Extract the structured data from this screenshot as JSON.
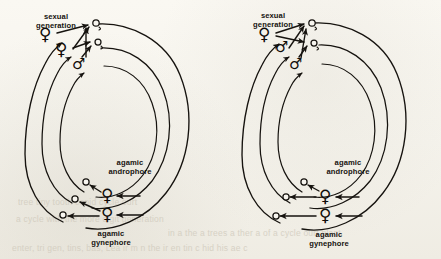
{
  "figure": {
    "background_color": "#f7f5ef",
    "ink_color": "#16130f",
    "panel_count": 2
  },
  "ghost_text": {
    "line1": "tree tiny tooth conid cycle ourt",
    "line2": "a cycle with the more digit generation",
    "line3": "in a the a trees a ther a of a cycle ourt plant",
    "line4": "enter, tri gen, tins, bas, Lea ir m n the ir en tin c hid his ae c"
  },
  "panels": [
    {
      "id": "panel-left",
      "name": "life-cycle-diagram-left",
      "labels": {
        "sexual_generation": [
          "sexual",
          "generation"
        ],
        "agamic_androphore": [
          "agamic",
          "androphore"
        ],
        "agamic_gynephore": [
          "agamic",
          "gynephore"
        ]
      },
      "nodes": [
        {
          "name": "sexual-female-outer",
          "glyph": "♀",
          "size": "big"
        },
        {
          "name": "sexual-female-middle",
          "glyph": "♀",
          "size": "big"
        },
        {
          "name": "sexual-male-inner",
          "glyph": "♂",
          "size": "mid"
        },
        {
          "name": "agamic-androphore-female",
          "glyph": "♀",
          "size": "big"
        },
        {
          "name": "agamic-gynephore-female",
          "glyph": "♀",
          "size": "big"
        }
      ],
      "egg_count": 6
    },
    {
      "id": "panel-right",
      "name": "life-cycle-diagram-right",
      "labels": {
        "sexual_generation": [
          "sexual",
          "generation"
        ],
        "agamic_androphore": [
          "agamic",
          "androphore"
        ],
        "agamic_gynephore": [
          "agamic",
          "gynephore"
        ]
      },
      "nodes": [
        {
          "name": "sexual-female-outer",
          "glyph": "♀",
          "size": "big"
        },
        {
          "name": "sexual-male-middle",
          "glyph": "♂",
          "size": "mid"
        },
        {
          "name": "sexual-male-inner",
          "glyph": "♂",
          "size": "mid"
        },
        {
          "name": "agamic-androphore-female",
          "glyph": "♀",
          "size": "big"
        },
        {
          "name": "agamic-gynephore-female",
          "glyph": "♀",
          "size": "big"
        }
      ],
      "egg_count": 5
    }
  ]
}
